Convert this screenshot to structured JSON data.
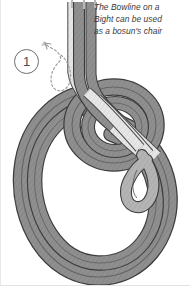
{
  "figure": {
    "step_number": "1",
    "caption_lines": [
      "The Bowline on a",
      "Bight can be used",
      "as a bosun's chair"
    ],
    "caption_text": "The Bowline on a Bight can be used as a bosun's chair"
  },
  "colors": {
    "background": "#ffffff",
    "rope_dark_fill": "#8f8f8f",
    "rope_dark_shade": "#777777",
    "rope_light_fill": "#e4e4e4",
    "rope_light_shade": "#cfcfcf",
    "rope_outline": "#3d3d3d",
    "rope_outline_soft": "#5a5a5a",
    "arrow_dashed": "#9a9a9a",
    "badge_stroke": "#6d6d6d",
    "caption_text": "#3a3a3a",
    "frame_border": "#e9e9e9"
  },
  "elements": {
    "standing_part_label": "standing part strands",
    "main_loop_label": "main rope loop",
    "bight_loop_label": "bight collar loop",
    "crossing_label": "rope crossing strands",
    "motion_arrow_label": "dashed motion arrow"
  }
}
